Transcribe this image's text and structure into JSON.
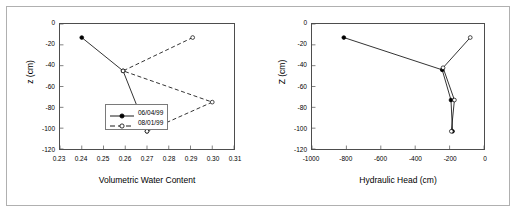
{
  "figure": {
    "border_color": "#b0b0b0",
    "background": "#ffffff"
  },
  "series_style": {
    "observed_color": "#000000",
    "predicted_color": "#000000"
  },
  "chart_data": [
    {
      "type": "line",
      "id": "volumetric-water-content",
      "title": "",
      "xlabel": "Volumetric Water Content",
      "ylabel": "z (cm)",
      "xlim": [
        0.23,
        0.31
      ],
      "ylim": [
        -120,
        0
      ],
      "xticks": [
        "0.23",
        "0.24",
        "0.25",
        "0.26",
        "0.27",
        "0.28",
        "0.29",
        "0.30",
        "0.31"
      ],
      "xtick_values": [
        0.23,
        0.24,
        0.25,
        0.26,
        0.27,
        0.28,
        0.29,
        0.3,
        0.31
      ],
      "yticks": [
        "0",
        "-20",
        "-40",
        "-60",
        "-80",
        "-100",
        "-120"
      ],
      "ytick_values": [
        0,
        -20,
        -40,
        -60,
        -80,
        -100,
        -120
      ],
      "grid": false,
      "legend_position": "center-left-inside",
      "series": [
        {
          "name": "06/04/99",
          "marker": "filled-circle",
          "line": "solid",
          "x": [
            0.24,
            0.259,
            0.27
          ],
          "y": [
            -13,
            -45,
            -103
          ]
        },
        {
          "name": "08/01/99",
          "marker": "open-circle",
          "line": "dashed",
          "x": [
            0.291,
            0.259,
            0.3,
            0.27
          ],
          "y": [
            -13,
            -45,
            -75,
            -103
          ]
        }
      ]
    },
    {
      "type": "line",
      "id": "hydraulic-head",
      "title": "",
      "xlabel": "Hydraulic Head (cm)",
      "ylabel": "Z (cm)",
      "xlim": [
        -1000,
        0
      ],
      "ylim": [
        -120,
        0
      ],
      "xticks": [
        "-1000",
        "-800",
        "-600",
        "-400",
        "-200",
        "0"
      ],
      "xtick_values": [
        -1000,
        -800,
        -600,
        -400,
        -200,
        0
      ],
      "yticks": [
        "0",
        "-20",
        "-40",
        "-60",
        "-80",
        "-100",
        "-120"
      ],
      "ytick_values": [
        0,
        -20,
        -40,
        -60,
        -80,
        -100,
        -120
      ],
      "grid": false,
      "legend_position": "none",
      "series": [
        {
          "name": "06/04/99",
          "marker": "filled-circle",
          "line": "solid",
          "x": [
            -815,
            -243,
            -192,
            -183
          ],
          "y": [
            -13,
            -44,
            -73,
            -103
          ]
        },
        {
          "name": "08/01/99",
          "marker": "open-circle",
          "line": "solid",
          "x": [
            -80,
            -238,
            -172,
            -190
          ],
          "y": [
            -13,
            -42,
            -73,
            -103
          ]
        }
      ]
    }
  ]
}
